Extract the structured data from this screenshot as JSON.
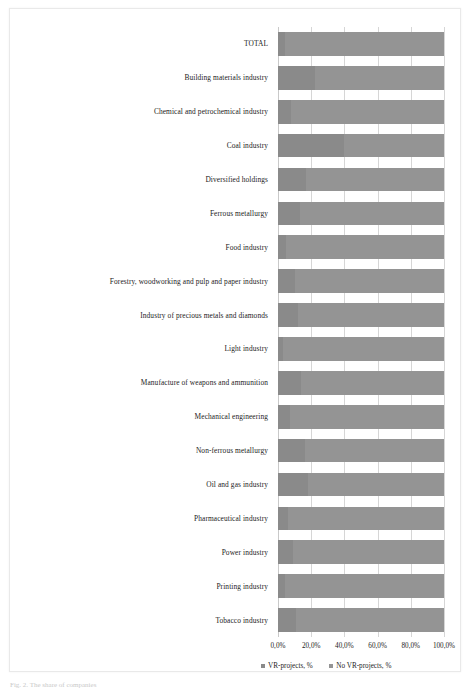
{
  "figure": {
    "caption": "Fig. 2. The share of companies"
  },
  "legend": {
    "position": "bottom",
    "items": [
      {
        "label": "VR-projects, %",
        "color": "#8a8a8a",
        "swatch": "legend-swatch-icon"
      },
      {
        "label": "No VR-projects, %",
        "color": "#949494",
        "swatch": "legend-swatch-icon"
      }
    ]
  },
  "axis": {
    "ticks": [
      "0,0%",
      "20,0%",
      "40,0%",
      "60,0%",
      "80,0%",
      "100,0%"
    ]
  },
  "chart_data": {
    "type": "bar",
    "orientation": "horizontal",
    "stacked": true,
    "stack_mode": "100%",
    "title": "",
    "xlabel": "",
    "ylabel": "",
    "xlim": [
      0,
      100
    ],
    "grid": true,
    "legend_position": "bottom",
    "tick_labels": [
      "0,0%",
      "20,0%",
      "40,0%",
      "60,0%",
      "80,0%",
      "100,0%"
    ],
    "categories": [
      "TOTAL",
      "Building materials industry",
      "Chemical and petrochemical industry",
      "Coal industry",
      "Diversified holdings",
      "Ferrous metallurgy",
      "Food industry",
      "Forestry, woodworking and pulp and paper industry",
      "Industry of precious metals and diamonds",
      "Light industry",
      "Manufacture of weapons and ammunition",
      "Mechanical engineering",
      "Non-ferrous metallurgy",
      "Oil and gas industry",
      "Pharmaceutical industry",
      "Power industry",
      "Printing industry",
      "Tobacco industry"
    ],
    "series": [
      {
        "name": "VR-projects, %",
        "color": "#8a8a8a",
        "values": [
          4.0,
          22.0,
          8.0,
          40.0,
          17.0,
          13.0,
          5.0,
          10.0,
          12.0,
          3.0,
          14.0,
          7.0,
          16.0,
          18.0,
          6.0,
          9.0,
          4.0,
          11.0
        ]
      },
      {
        "name": "No VR-projects, %",
        "color": "#949494",
        "values": [
          96.0,
          78.0,
          92.0,
          60.0,
          83.0,
          87.0,
          95.0,
          90.0,
          88.0,
          97.0,
          86.0,
          93.0,
          84.0,
          82.0,
          94.0,
          91.0,
          96.0,
          89.0
        ]
      }
    ]
  }
}
